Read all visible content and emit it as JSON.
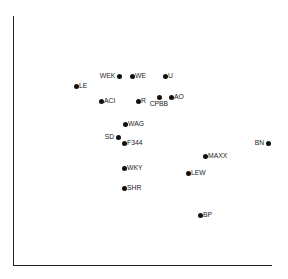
{
  "chart_data": {
    "type": "scatter",
    "title": "",
    "xlabel": "",
    "ylabel": "",
    "grid": false,
    "legend": null,
    "axes": {
      "x_ticks": [],
      "y_ticks": []
    },
    "points": [
      {
        "label": "LE",
        "x": 76,
        "y": 86,
        "label_side": "right"
      },
      {
        "label": "WEK",
        "x": 119,
        "y": 76,
        "label_side": "left"
      },
      {
        "label": "WE",
        "x": 132,
        "y": 76,
        "label_side": "right"
      },
      {
        "label": "U",
        "x": 165,
        "y": 76,
        "label_side": "right"
      },
      {
        "label": "ACI",
        "x": 101,
        "y": 101,
        "label_side": "right"
      },
      {
        "label": "R",
        "x": 138,
        "y": 101,
        "label_side": "right"
      },
      {
        "label": "CPBB",
        "x": 159,
        "y": 97,
        "label_side": "below"
      },
      {
        "label": "AO",
        "x": 171,
        "y": 97,
        "label_side": "right"
      },
      {
        "label": "WAG",
        "x": 125,
        "y": 124,
        "label_side": "right"
      },
      {
        "label": "SD",
        "x": 118,
        "y": 137,
        "label_side": "left"
      },
      {
        "label": "F344",
        "x": 124,
        "y": 143,
        "label_side": "right"
      },
      {
        "label": "WKY",
        "x": 124,
        "y": 168,
        "label_side": "right"
      },
      {
        "label": "SHR",
        "x": 124,
        "y": 188,
        "label_side": "right"
      },
      {
        "label": "BN",
        "x": 268,
        "y": 143,
        "label_side": "left"
      },
      {
        "label": "MAXX",
        "x": 205,
        "y": 156,
        "label_side": "right"
      },
      {
        "label": "LEW",
        "x": 188,
        "y": 173,
        "label_side": "right"
      },
      {
        "label": "BP",
        "x": 200,
        "y": 215,
        "label_side": "right"
      }
    ],
    "note": "Coordinates are pixel positions within the 288x279 frame; axes have no ticks or labels."
  }
}
